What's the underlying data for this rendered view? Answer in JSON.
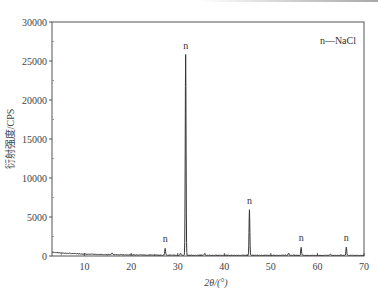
{
  "chart_data": {
    "type": "line",
    "title": "",
    "xlabel": "2θ/(°)",
    "ylabel": "衍射强度/CPS",
    "xlim": [
      3,
      70
    ],
    "ylim": [
      0,
      30000
    ],
    "x_ticks": [
      10,
      20,
      30,
      40,
      50,
      60,
      70
    ],
    "y_ticks": [
      0,
      5000,
      10000,
      15000,
      20000,
      25000,
      30000
    ],
    "grid": false,
    "legend": {
      "text": "n—NaCl",
      "position": "upper right"
    },
    "series": [
      {
        "name": "XRD pattern",
        "baseline": [
          [
            3,
            500
          ],
          [
            5,
            380
          ],
          [
            10,
            250
          ],
          [
            15,
            180
          ],
          [
            20,
            140
          ],
          [
            25,
            120
          ],
          [
            30,
            110
          ],
          [
            40,
            100
          ],
          [
            50,
            100
          ],
          [
            60,
            95
          ],
          [
            70,
            90
          ]
        ],
        "peaks": [
          {
            "x": 27.3,
            "y": 1000,
            "label": "n"
          },
          {
            "x": 31.7,
            "y": 25800,
            "label": "n"
          },
          {
            "x": 45.4,
            "y": 5900,
            "label": "n"
          },
          {
            "x": 56.5,
            "y": 1100,
            "label": "n"
          },
          {
            "x": 66.2,
            "y": 1100,
            "label": "n"
          }
        ]
      }
    ],
    "annotations": [
      "n",
      "n",
      "n",
      "n",
      "n"
    ],
    "color": "#333333"
  },
  "labels": {
    "ylabel": "衍射强度/CPS",
    "xlabel": "2θ/(°)",
    "legend": "n—NaCl",
    "peak": "n"
  }
}
